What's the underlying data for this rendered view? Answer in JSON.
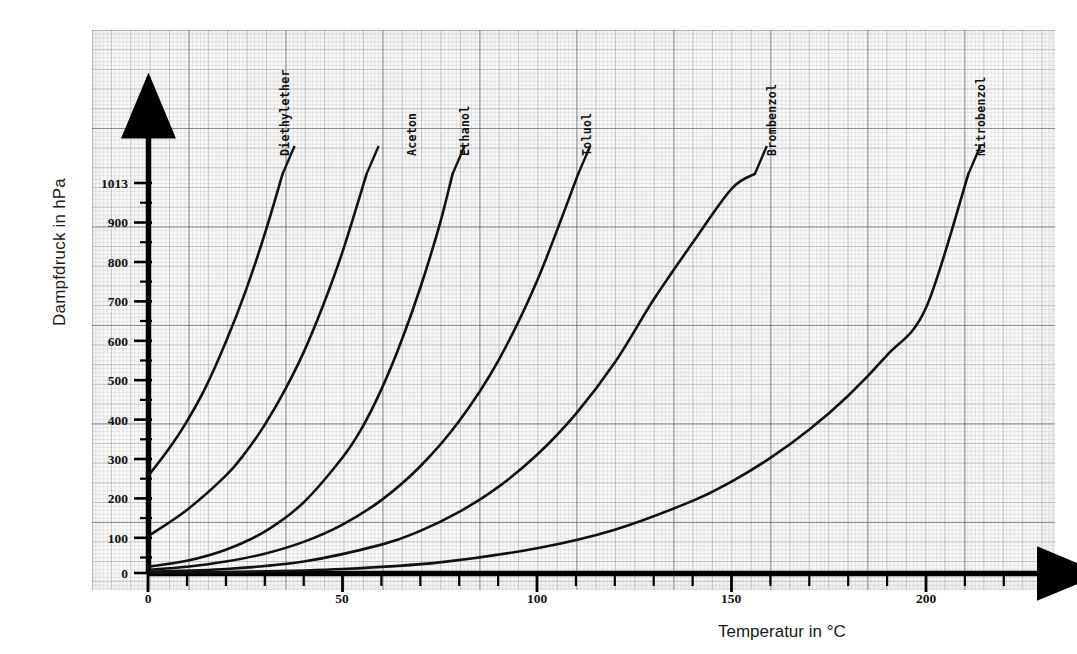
{
  "figure": {
    "title": "",
    "background_color": "#ffffff",
    "paper_color": "#fbfbf9",
    "grid_color": "#5a5a6e",
    "curve_color": "#111111"
  },
  "axes": {
    "x_title": "Temperatur in °C",
    "y_title": "Dampfdruck in hPa",
    "x_ticks": [
      "0",
      "50",
      "100",
      "150",
      "200"
    ],
    "y_ticks": [
      "0",
      "100",
      "200",
      "300",
      "400",
      "500",
      "600",
      "700",
      "800",
      "900",
      "1013"
    ]
  },
  "curve_labels": [
    {
      "text": "Diethylether"
    },
    {
      "text": "Aceton"
    },
    {
      "text": "Ethanol"
    },
    {
      "text": "Toluol"
    },
    {
      "text": "Brombenzol"
    },
    {
      "text": "Nitrobenzol"
    }
  ],
  "chart_data": {
    "type": "line",
    "title": "",
    "xlabel": "Temperatur in °C",
    "ylabel": "Dampfdruck in hPa",
    "xlim": [
      0,
      233
    ],
    "ylim": [
      0,
      1065
    ],
    "xtick_values": [
      0,
      50,
      100,
      150,
      200
    ],
    "xtick_labels": [
      "0",
      "50",
      "100",
      "150",
      "200"
    ],
    "ytick_values": [
      0,
      100,
      200,
      300,
      400,
      500,
      600,
      700,
      800,
      900,
      1013
    ],
    "ytick_labels": [
      "0",
      "100",
      "200",
      "300",
      "400",
      "500",
      "600",
      "700",
      "800",
      "900",
      "1013"
    ],
    "grid": true,
    "grid_style": "millimeter graph paper",
    "legend": "inline curve labels at end of each curve",
    "annotations": [
      "1013 hPa is the normal atmospheric pressure reference line; each curve reaches it at the substance's boiling point."
    ],
    "series": [
      {
        "name": "Diethylether",
        "boiling_point_C": 35,
        "x": [
          0,
          5,
          10,
          15,
          20,
          25,
          30,
          34.6
        ],
        "y": [
          246,
          310,
          385,
          475,
          586,
          713,
          860,
          1013
        ]
      },
      {
        "name": "Aceton",
        "boiling_point_C": 56,
        "x": [
          0,
          10,
          20,
          25,
          30,
          35,
          40,
          45,
          50,
          56.2
        ],
        "y": [
          93,
          160,
          247,
          305,
          376,
          461,
          560,
          679,
          815,
          1013
        ]
      },
      {
        "name": "Ethanol",
        "boiling_point_C": 78,
        "x": [
          0,
          10,
          20,
          30,
          40,
          50,
          55,
          60,
          65,
          70,
          75,
          78.3
        ],
        "y": [
          16,
          31,
          59,
          105,
          179,
          293,
          368,
          466,
          585,
          724,
          885,
          1013
        ]
      },
      {
        "name": "Toluol",
        "boiling_point_C": 111,
        "x": [
          0,
          10,
          20,
          30,
          40,
          50,
          60,
          70,
          80,
          90,
          100,
          110.6
        ],
        "y": [
          8,
          16,
          29,
          49,
          79,
          123,
          185,
          271,
          386,
          538,
          741,
          1013
        ]
      },
      {
        "name": "Brombenzol",
        "boiling_point_C": 156,
        "x": [
          0,
          20,
          40,
          60,
          70,
          80,
          90,
          100,
          110,
          120,
          130,
          140,
          150,
          156
        ],
        "y": [
          3,
          10,
          29,
          72,
          107,
          155,
          218,
          300,
          404,
          534,
          694,
          838,
          975,
          1013
        ]
      },
      {
        "name": "Nitrobenzol",
        "boiling_point_C": 211,
        "x": [
          0,
          25,
          50,
          75,
          100,
          120,
          140,
          150,
          160,
          170,
          180,
          190,
          200,
          210.9
        ],
        "y": [
          1,
          3,
          10,
          27,
          63,
          110,
          183,
          232,
          292,
          364,
          450,
          553,
          673,
          1013
        ]
      }
    ]
  }
}
